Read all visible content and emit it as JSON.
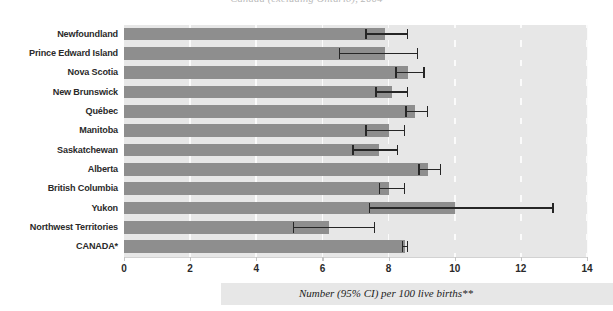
{
  "figure": {
    "title_clipped": "Canada (excluding Ontario), 2004",
    "caption": "Number (95% CI) per 100 live births**",
    "colors": {
      "bar": "#8e8e8e",
      "plot_background": "#e7e7e7",
      "gridline": "#fbfbfb",
      "error_bar": "#262626",
      "axis_text": "#2a2a2a"
    }
  },
  "chart_data": {
    "type": "bar",
    "orientation": "horizontal",
    "title": "Canada (excluding Ontario), 2004",
    "xlabel": "Number (95% CI) per 100 live births**",
    "ylabel": "",
    "xlim": [
      0,
      14
    ],
    "xticks": [
      0,
      2,
      4,
      6,
      8,
      10,
      12,
      14
    ],
    "xtick_labels": [
      "0",
      "2",
      "4",
      "6",
      "8",
      "10",
      "12",
      "14"
    ],
    "grid": "vertical",
    "legend": "none",
    "categories": [
      "Newfoundland",
      "Prince Edward Island",
      "Nova Scotia",
      "New Brunswick",
      "Québec",
      "Manitoba",
      "Saskatchewan",
      "Alberta",
      "British Columbia",
      "Yukon",
      "Northwest Territories",
      "CANADA*"
    ],
    "values": [
      7.9,
      7.9,
      8.6,
      8.1,
      8.8,
      8.0,
      7.7,
      9.2,
      8.0,
      10.0,
      6.2,
      8.5
    ],
    "ci_low": [
      7.3,
      6.5,
      8.2,
      7.6,
      8.5,
      7.3,
      6.9,
      8.9,
      7.7,
      7.4,
      5.1,
      8.4
    ],
    "ci_high": [
      8.6,
      8.9,
      9.1,
      8.6,
      9.2,
      8.5,
      8.3,
      9.6,
      8.5,
      13.0,
      7.6,
      8.6
    ]
  }
}
